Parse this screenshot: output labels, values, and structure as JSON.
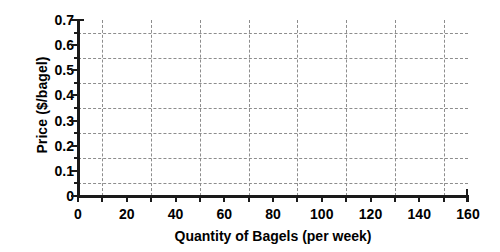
{
  "chart_data": {
    "type": "line",
    "title": "",
    "subtitle": "",
    "xlabel": "Quantity of Bagels (per week)",
    "ylabel": "Price ($/bagel)",
    "xlim": [
      0,
      160
    ],
    "ylim": [
      0,
      0.7
    ],
    "x_tick_labels": [
      "0",
      "20",
      "40",
      "60",
      "80",
      "100",
      "120",
      "140",
      "160"
    ],
    "x_tick_values": [
      0,
      20,
      40,
      60,
      80,
      100,
      120,
      140,
      160
    ],
    "x_minor_tick_values": [
      10,
      30,
      50,
      70,
      90,
      110,
      130,
      150
    ],
    "y_tick_labels": [
      "0",
      "0.1",
      "0.2",
      "0.3",
      "0.4",
      "0.5",
      "0.6",
      "0.7"
    ],
    "y_tick_values": [
      0,
      0.1,
      0.2,
      0.3,
      0.4,
      0.5,
      0.6,
      0.7
    ],
    "y_minor_tick_values": [
      0.05,
      0.15,
      0.25,
      0.35,
      0.45,
      0.55,
      0.65
    ],
    "grid": true,
    "grid_style": "dashed",
    "grid_color": "#8d8d8d",
    "grid_horizontal_values": [
      0.05,
      0.15,
      0.25,
      0.35,
      0.45,
      0.55,
      0.65
    ],
    "grid_vertical_values": [
      10,
      30,
      50,
      70,
      90,
      110,
      130,
      150
    ],
    "legend": null,
    "legend_position": "none",
    "series": [],
    "annotations": [],
    "axis_color": "#1a1a1a",
    "background_color": "#ffffff",
    "note": "Empty grid template — no data series plotted; blank axes for plotting a demand/supply curve."
  }
}
